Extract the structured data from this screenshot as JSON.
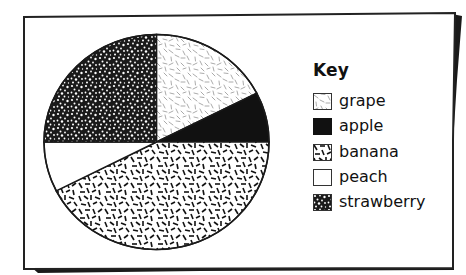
{
  "chart_data": {
    "type": "pie",
    "title": "",
    "legend_title": "Key",
    "legend_position": "right",
    "start_angle_deg": 90,
    "direction": "clockwise",
    "categories": [
      "grape",
      "apple",
      "banana",
      "peach",
      "strawberry"
    ],
    "values": [
      7,
      3,
      17,
      3,
      10
    ],
    "angles_deg": [
      63,
      27,
      153,
      27,
      90
    ],
    "percentages": [
      17.5,
      7.5,
      42.5,
      7.5,
      25
    ],
    "fills": [
      "pattern-grape-light-dashes",
      "solid-black",
      "pattern-banana-dark-dashes",
      "white",
      "pattern-strawberry-dense-speckle"
    ]
  },
  "legend": {
    "title": "Key",
    "items": [
      {
        "label": "grape",
        "fill": "url(#pat-grape)"
      },
      {
        "label": "apple",
        "fill": "#111111"
      },
      {
        "label": "banana",
        "fill": "url(#pat-banana)"
      },
      {
        "label": "peach",
        "fill": "#ffffff"
      },
      {
        "label": "strawberry",
        "fill": "url(#pat-straw)"
      }
    ]
  },
  "colors": {
    "ink": "#111111",
    "paper": "#ffffff",
    "grape_dash": "#9a9a9a"
  }
}
